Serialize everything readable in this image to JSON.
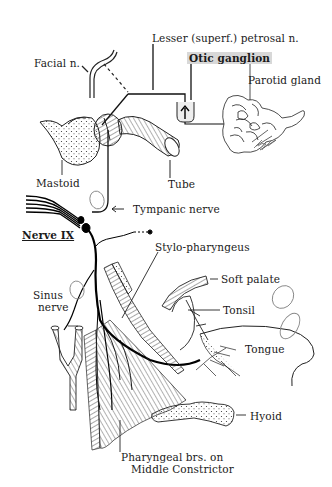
{
  "figure": {
    "subject": "Nerve IX",
    "background": "#ffffff",
    "ink": "#1a1a1a",
    "highlight": "#d8d8d8"
  },
  "labels": {
    "lesser_petrosal": "Lesser (superf.) petrosal n.",
    "facial": "Facial n.",
    "otic_ganglion": "Otic ganglion",
    "parotid": "Parotid gland",
    "mastoid": "Mastoid",
    "tube": "Tube",
    "tympanic": "Tympanic nerve",
    "nerve_ix": "Nerve IX",
    "stylo": "Stylo-pharyngeus",
    "soft_palate": "Soft palate",
    "sinus_line1": "Sinus",
    "sinus_line2": "nerve",
    "tonsil": "Tonsil",
    "tongue": "Tongue",
    "hyoid": "Hyoid",
    "pharyngeal_line1": "Pharyngeal brs. on",
    "pharyngeal_line2": "Middle Constrictor"
  },
  "handwritten_marks": {
    "tympanic_oval": "I",
    "sinus_oval": "N",
    "tonsil_oval": "Tonsil",
    "tongue_oval": "Tongue"
  },
  "signature": "JCB"
}
